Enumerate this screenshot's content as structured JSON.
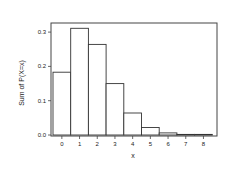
{
  "chart_data": {
    "type": "bar",
    "title": "",
    "xlabel": "x",
    "ylabel": "Sum of P(X=x)",
    "categories": [
      "0",
      "1",
      "2",
      "3",
      "4",
      "5",
      "6",
      "7",
      "8"
    ],
    "values": [
      0.183,
      0.311,
      0.264,
      0.15,
      0.064,
      0.022,
      0.006,
      0.001,
      0.0003
    ],
    "ylim": [
      0,
      0.33
    ],
    "yticks": [
      "0.0",
      "0.1",
      "0.2",
      "0.3"
    ],
    "grid": false,
    "legend": null,
    "bar_fill": "#ffffff",
    "bar_stroke": "#333333"
  }
}
